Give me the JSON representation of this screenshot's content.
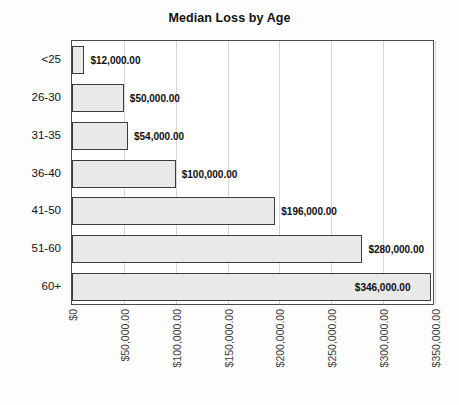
{
  "chart_data": {
    "type": "bar",
    "orientation": "horizontal",
    "title": "Median Loss by Age",
    "xlabel": "",
    "ylabel": "",
    "categories": [
      "<25",
      "26-30",
      "31-35",
      "36-40",
      "41-50",
      "51-60",
      "60+"
    ],
    "values": [
      12000,
      50000,
      54000,
      100000,
      196000,
      280000,
      346000
    ],
    "value_labels": [
      "$12,000.00",
      "$50,000.00",
      "$54,000.00",
      "$100,000.00",
      "$196,000.00",
      "$280,000.00",
      "$346,000.00"
    ],
    "xlim": [
      0,
      350000
    ],
    "xticks": [
      0,
      50000,
      100000,
      150000,
      200000,
      250000,
      300000,
      350000
    ],
    "xticklabels": [
      "$0",
      "$50,000.00",
      "$100,000.00",
      "$150,000.00",
      "$200,000.00",
      "$250,000.00",
      "$300,000.00",
      "$350,000.00"
    ],
    "grid": true,
    "grid_axis": "x",
    "legend": null,
    "colors": {
      "bar_fill": "#e9e9e9",
      "bar_border": "#3d3d3d",
      "grid": "#d7d7d7",
      "frame": "#4a4a4a",
      "text": "#111111",
      "background": "#fdfdfd"
    }
  }
}
